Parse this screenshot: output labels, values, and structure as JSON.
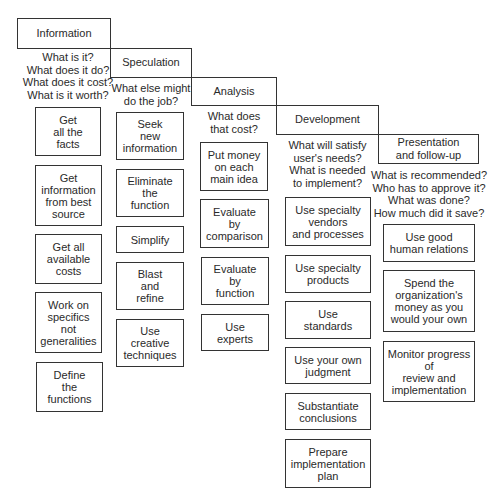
{
  "stages": [
    {
      "name": "Information",
      "questions": "What is it?\nWhat does it do?\nWhat does it cost?\nWhat is it worth?",
      "actions": [
        "Get\nall the\nfacts",
        "Get\ninformation\nfrom best\nsource",
        "Get all\navailable\ncosts",
        "Work on\nspecifics\nnot\ngeneralities",
        "Define\nthe\nfunctions"
      ]
    },
    {
      "name": "Speculation",
      "questions": "What else might\ndo the job?",
      "actions": [
        "Seek\nnew\ninformation",
        "Eliminate\nthe\nfunction",
        "Simplify",
        "Blast\nand\nrefine",
        "Use\ncreative\ntechniques"
      ]
    },
    {
      "name": "Analysis",
      "questions": "What does\nthat cost?",
      "actions": [
        "Put money\non each\nmain idea",
        "Evaluate\nby\ncomparison",
        "Evaluate\nby\nfunction",
        "Use\nexperts"
      ]
    },
    {
      "name": "Development",
      "questions": "What will satisfy\nuser's needs?\nWhat is needed\nto implement?",
      "actions": [
        "Use specialty\nvendors\nand processes",
        "Use specialty\nproducts",
        "Use\nstandards",
        "Use your own\njudgment",
        "Substantiate\nconclusions",
        "Prepare\nimplementation\nplan"
      ]
    },
    {
      "name": "Presentation\nand follow-up",
      "questions": "What is recommended?\nWho has to approve it?\nWhat was done?\nHow much did it save?",
      "actions": [
        "Use good\nhuman relations",
        "Spend the\norganization's\nmoney as you\nwould your own",
        "Monitor progress\nof\nreview and\nimplementation"
      ]
    }
  ]
}
